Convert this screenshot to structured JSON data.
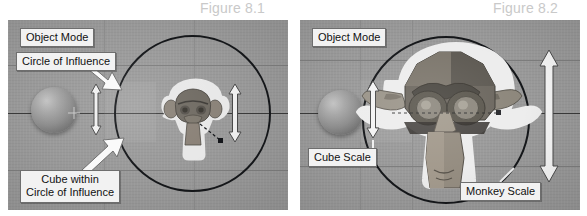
{
  "figures": {
    "left": {
      "caption": "Figure 8.1",
      "labels": [
        {
          "id": "object-mode",
          "text": "Object Mode"
        },
        {
          "id": "circle-of-influence",
          "text": "Circle of Influence"
        },
        {
          "id": "cube-within",
          "line1": "Cube within",
          "line2": "Circle of Influence"
        }
      ],
      "objects": {
        "sphere_name": "cube-sphere-object",
        "monkey_name": "monkey-head-object",
        "circle_name": "circle-of-influence-outline"
      },
      "arrows": {
        "cube_scale_arrow": "cube-scale-arrow",
        "monkey_scale_arrow": "monkey-scale-arrow"
      }
    },
    "right": {
      "caption": "Figure 8.2",
      "labels": [
        {
          "id": "object-mode",
          "text": "Object Mode"
        },
        {
          "id": "cube-scale",
          "text": "Cube Scale"
        },
        {
          "id": "monkey-scale",
          "text": "Monkey Scale"
        }
      ],
      "objects": {
        "sphere_name": "cube-sphere-object",
        "monkey_name": "monkey-head-object",
        "circle_name": "circle-of-influence-outline"
      }
    }
  },
  "colors": {
    "viewport_background": "#9a9a9a",
    "caption_text": "#c9c9c9",
    "label_background": "#f2f2f2",
    "label_text": "#111111",
    "circle_outline": "#15171a",
    "arrow_fill": "#f0f0f0",
    "arrow_outline": "#3a3a3a",
    "page_background": "#ffffff"
  }
}
